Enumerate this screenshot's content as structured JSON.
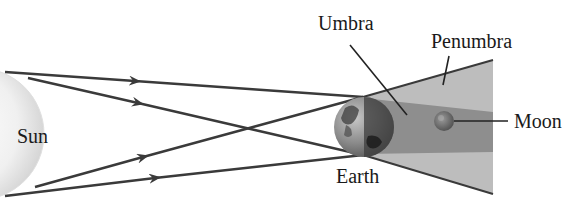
{
  "diagram": {
    "type": "lunar-eclipse-geometry",
    "labels": {
      "sun": "Sun",
      "earth": "Earth",
      "moon": "Moon",
      "umbra": "Umbra",
      "penumbra": "Penumbra"
    },
    "colors": {
      "sun_fill": "#f2f2f2",
      "sun_edge": "#d0d0d0",
      "penumbra_fill": "#b9b9b9",
      "umbra_fill": "#8f8f8f",
      "ray_color": "#3a3a3a",
      "earth_light": "#9a9a9a",
      "earth_dark": "#3c3c3c"
    },
    "rays": [
      {
        "from": [
          5,
          72
        ],
        "to": [
          363,
          97
        ]
      },
      {
        "from": [
          28,
          78
        ],
        "to": [
          363,
          155
        ]
      },
      {
        "from": [
          35,
          187
        ],
        "to": [
          363,
          97
        ]
      },
      {
        "from": [
          5,
          196
        ],
        "to": [
          363,
          155
        ]
      }
    ]
  }
}
